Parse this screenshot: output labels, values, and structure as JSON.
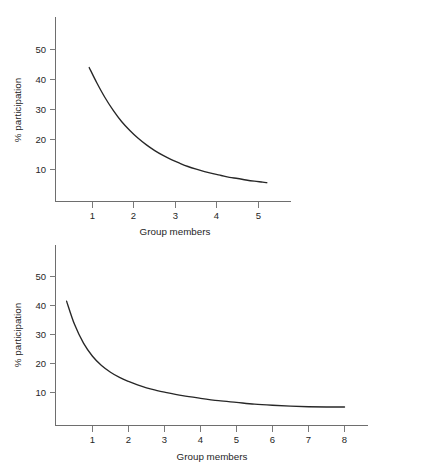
{
  "figure": {
    "background_color": "#ffffff",
    "curve_color": "#272727",
    "axis_color": "#6e6e6e",
    "partial_footnote": ""
  },
  "charts": [
    {
      "id": "top",
      "ylabel": "% participation",
      "xlabel": "Group members",
      "y_ticks": [
        "10",
        "20",
        "30",
        "40",
        "50"
      ],
      "x_ticks": [
        "1",
        "2",
        "3",
        "4",
        "5"
      ]
    },
    {
      "id": "bottom",
      "ylabel": "% participation",
      "xlabel": "Group members",
      "y_ticks": [
        "10",
        "20",
        "30",
        "40",
        "50"
      ],
      "x_ticks": [
        "1",
        "2",
        "3",
        "4",
        "5",
        "6",
        "7",
        "8"
      ]
    }
  ],
  "chart_data": [
    {
      "type": "line",
      "id": "top-panel",
      "title": "",
      "xlabel": "Group members",
      "ylabel": "% participation",
      "xlim": [
        0.0,
        5.75
      ],
      "ylim": [
        0,
        57
      ],
      "grid": false,
      "legend": "none",
      "x_ticks": [
        1,
        2,
        3,
        4,
        5
      ],
      "y_ticks": [
        10,
        20,
        30,
        40,
        50
      ],
      "series": [
        {
          "name": "% participation",
          "x": [
            0.92,
            1.1,
            1.3,
            1.5,
            1.7,
            1.9,
            2.1,
            2.3,
            2.5,
            2.7,
            2.9,
            3.1,
            3.3,
            3.5,
            3.7,
            3.9,
            4.1,
            4.3,
            4.5,
            4.7,
            4.9,
            5.1,
            5.2
          ],
          "y": [
            44.0,
            39.0,
            34.0,
            29.7,
            26.0,
            23.0,
            20.4,
            18.2,
            16.3,
            14.7,
            13.3,
            12.1,
            11.0,
            10.1,
            9.3,
            8.6,
            8.0,
            7.4,
            7.0,
            6.5,
            6.1,
            5.8,
            5.6
          ]
        }
      ]
    },
    {
      "type": "line",
      "id": "bottom-panel",
      "title": "",
      "xlabel": "Group members",
      "ylabel": "% participation",
      "xlim": [
        0.0,
        8.7
      ],
      "ylim": [
        0,
        57
      ],
      "grid": false,
      "legend": "none",
      "x_ticks": [
        1,
        2,
        3,
        4,
        5,
        6,
        7,
        8
      ],
      "y_ticks": [
        10,
        20,
        30,
        40,
        50
      ],
      "series": [
        {
          "name": "% participation",
          "x": [
            0.28,
            0.5,
            0.75,
            1.0,
            1.25,
            1.5,
            1.75,
            2.0,
            2.25,
            2.5,
            2.75,
            3.0,
            3.5,
            4.0,
            4.5,
            5.0,
            5.5,
            6.0,
            6.5,
            7.0,
            7.5,
            8.0
          ],
          "y": [
            41.5,
            33.5,
            27.0,
            22.5,
            19.3,
            17.0,
            15.2,
            13.8,
            12.6,
            11.6,
            10.8,
            10.1,
            8.9,
            8.0,
            7.2,
            6.6,
            6.0,
            5.6,
            5.3,
            5.1,
            5.0,
            5.0
          ]
        }
      ]
    }
  ]
}
